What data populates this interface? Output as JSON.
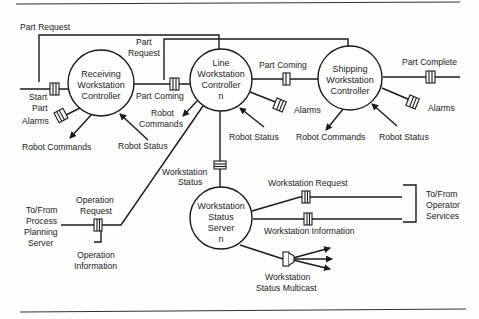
{
  "diagram": {
    "nodes": {
      "receiving": {
        "lines": [
          "Receiving",
          "Workstation",
          "Controller"
        ]
      },
      "line": {
        "lines": [
          "Line",
          "Workstation",
          "Controller",
          "n"
        ]
      },
      "shipping": {
        "lines": [
          "Shipping",
          "Workstation",
          "Controller"
        ]
      },
      "status_server": {
        "lines": [
          "Workstation",
          "Status",
          "Server",
          "n"
        ]
      }
    },
    "labels": {
      "part_request_top": "Part Request",
      "part_request_line_1": "Part",
      "part_request_line_2": "Request",
      "start_part_1": "Start",
      "start_part_2": "Part",
      "alarms_receiving": "Alarms",
      "robot_commands_receiving": "Robot Commands",
      "robot_status_receiving": "Robot Status",
      "part_coming_1": "Part Coming",
      "robot_commands_line_1": "Robot",
      "robot_commands_line_2": "Commands",
      "robot_status_line": "Robot Status",
      "alarms_line": "Alarms",
      "part_coming_2": "Part Coming",
      "part_complete": "Part Complete",
      "alarms_shipping": "Alarms",
      "robot_commands_shipping": "Robot Commands",
      "robot_status_shipping": "Robot Status",
      "workstation_status_1": "Workstation",
      "workstation_status_2": "Status",
      "to_from_process_1": "To/From",
      "to_from_process_2": "Process",
      "to_from_process_3": "Planning",
      "to_from_process_4": "Server",
      "operation_request_1": "Operation",
      "operation_request_2": "Request",
      "operation_information_1": "Operation",
      "operation_information_2": "Information",
      "workstation_request": "Workstation Request",
      "workstation_information": "Workstation Information",
      "to_from_operator_1": "To/From",
      "to_from_operator_2": "Operator",
      "to_from_operator_3": "Services",
      "multicast_1": "Workstation",
      "multicast_2": "Status Multicast"
    }
  }
}
